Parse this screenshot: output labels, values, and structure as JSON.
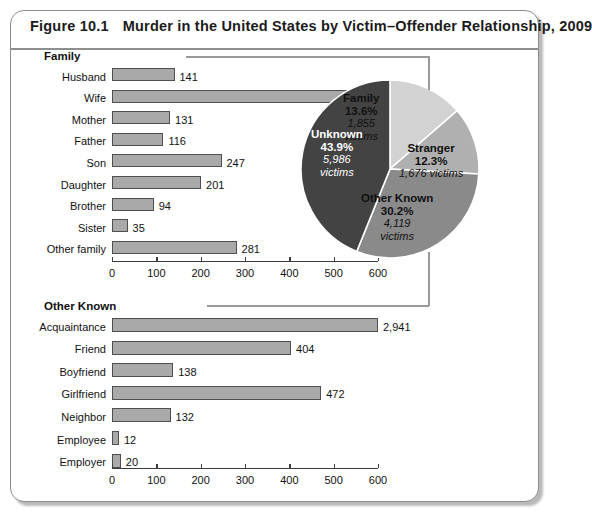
{
  "figure": {
    "number": "Figure 10.1",
    "title": "Murder in the United States by Victim–Offender Relationship, 2009"
  },
  "colors": {
    "bar_fill": "#a9a9a9",
    "bar_stroke": "#4f4f4f",
    "pie_family": "#d2d2d2",
    "pie_stranger": "#b0b0b0",
    "pie_other_known": "#8a8a8a",
    "pie_unknown": "#434343",
    "axis": "#3d3d3d",
    "bracket": "#9a9a9a"
  },
  "chart_data": [
    {
      "type": "pie",
      "title": "Murder victims by victim–offender relationship, 2009",
      "legend": "labels-on-slices",
      "slices": [
        {
          "label": "Family",
          "percent": 13.6,
          "percent_text": "13.6%",
          "victims": 1855,
          "victims_text": "1,855",
          "victims_suffix": "victims",
          "color": "#d2d2d2"
        },
        {
          "label": "Stranger",
          "percent": 12.3,
          "percent_text": "12.3%",
          "victims": 1676,
          "victims_text": "1,676",
          "victims_suffix": "victims",
          "color": "#b0b0b0"
        },
        {
          "label": "Other Known",
          "percent": 30.2,
          "percent_text": "30.2%",
          "victims": 4119,
          "victims_text": "4,119",
          "victims_suffix": "victims",
          "color": "#8a8a8a"
        },
        {
          "label": "Unknown",
          "percent": 43.9,
          "percent_text": "43.9%",
          "victims": 5986,
          "victims_text": "5,986",
          "victims_suffix": "victims",
          "color": "#434343"
        }
      ]
    },
    {
      "type": "bar",
      "orientation": "horizontal",
      "title": "Family",
      "xlabel": "",
      "ylabel": "",
      "xlim": [
        0,
        600
      ],
      "xticks": [
        0,
        100,
        200,
        300,
        400,
        500,
        600
      ],
      "xtick_labels": [
        "0",
        "100",
        "200",
        "300",
        "400",
        "500",
        "600"
      ],
      "grid": false,
      "categories": [
        "Husband",
        "Wife",
        "Mother",
        "Father",
        "Son",
        "Daughter",
        "Brother",
        "Sister",
        "Other family"
      ],
      "values": [
        141,
        609,
        131,
        116,
        247,
        201,
        94,
        35,
        281
      ],
      "value_labels": [
        "141",
        "609",
        "131",
        "116",
        "247",
        "201",
        "94",
        "35",
        "281"
      ]
    },
    {
      "type": "bar",
      "orientation": "horizontal",
      "title": "Other Known",
      "xlabel": "",
      "ylabel": "",
      "xlim": [
        0,
        600
      ],
      "xticks": [
        0,
        100,
        200,
        300,
        400,
        500,
        600
      ],
      "xtick_labels": [
        "0",
        "100",
        "200",
        "300",
        "400",
        "500",
        "600"
      ],
      "grid": false,
      "categories": [
        "Acquaintance",
        "Friend",
        "Boyfriend",
        "Girlfriend",
        "Neighbor",
        "Employee",
        "Employer"
      ],
      "values": [
        2941,
        404,
        138,
        472,
        132,
        12,
        20
      ],
      "value_labels": [
        "2,941",
        "404",
        "138",
        "472",
        "132",
        "12",
        "20"
      ],
      "notes": "Acquaintance bar (2,941) exceeds the 0–600 axis and is drawn clipped."
    }
  ]
}
